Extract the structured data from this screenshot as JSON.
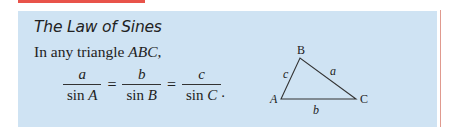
{
  "box": {
    "title": "The Law of Sines",
    "intro_prefix": "In any triangle ",
    "intro_var": "ABC",
    "intro_suffix": ","
  },
  "formula": {
    "fractions": [
      {
        "numerator": "a",
        "den_func": "sin ",
        "den_var": "A"
      },
      {
        "numerator": "b",
        "den_func": "sin ",
        "den_var": "B"
      },
      {
        "numerator": "c",
        "den_func": "sin ",
        "den_var": "C"
      }
    ],
    "equals": "=",
    "period": "."
  },
  "triangle": {
    "vertices": {
      "A": "A",
      "B": "B",
      "C": "C"
    },
    "sides": {
      "a": "a",
      "b": "b",
      "c": "c"
    }
  },
  "colors": {
    "box_background": "#cfe3f3",
    "accent_red": "#e8534a",
    "rule_red": "#e09a8f"
  }
}
